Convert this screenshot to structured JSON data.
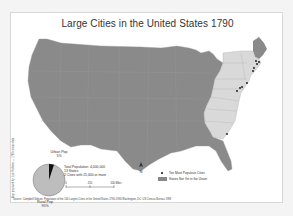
{
  "map": {
    "title": "Large Cities in the United States 1790",
    "colors": {
      "territory": "#8a8a8a",
      "union_states": "#d9d9d9",
      "state_border": "#b0b0b0",
      "city_dot": "#111111",
      "background": "#ffffff"
    },
    "cities": [
      {
        "name": "New York",
        "x": 246,
        "y": 82
      },
      {
        "name": "Philadelphia",
        "x": 239,
        "y": 87
      },
      {
        "name": "Boston",
        "x": 256,
        "y": 63
      },
      {
        "name": "Charleston",
        "x": 226,
        "y": 133
      },
      {
        "name": "Baltimore",
        "x": 236,
        "y": 90
      },
      {
        "name": "Northern Liberties",
        "x": 241,
        "y": 86
      },
      {
        "name": "Salem",
        "x": 258,
        "y": 61
      },
      {
        "name": "Newport",
        "x": 252,
        "y": 70
      },
      {
        "name": "Providence",
        "x": 253,
        "y": 67
      },
      {
        "name": "Marblehead",
        "x": 255,
        "y": 60
      }
    ]
  },
  "pie": {
    "urban_label": "Urban Pop",
    "urban_value": "5%",
    "rural_label": "Rural Pop",
    "rural_value": "95%"
  },
  "summary": {
    "population": "Total Population: 4,000,000",
    "states": "13 States",
    "cities": "2 Cities with 25,000 or more"
  },
  "scale": {
    "ticks": [
      "0",
      "250",
      "500 Miles"
    ],
    "north_label": "N"
  },
  "legend": {
    "cities_label": "Ten Most Populous Cities",
    "states_label": "States Not Yet in the Union"
  },
  "credit": "Map prepared by: Lyle Rollston — 1790 census data",
  "source": "Source: Campbell Gibson, Population of the 100 Largest Cities in the United States 1790-1990 Washington, DC: US Census Bureau 1998"
}
